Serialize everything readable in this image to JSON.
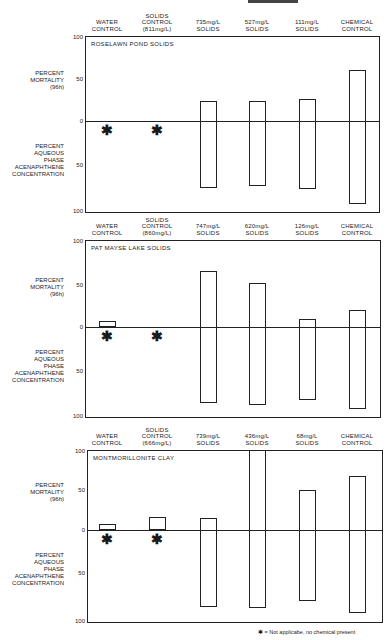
{
  "chart_data": {
    "type": "bar",
    "layout": "three stacked panels, bidirectional bars (mortality up from 0, concentration down from 0)",
    "y_axis_upper": {
      "label": "PERCENT MORTALITY (96h)",
      "range": [
        0,
        100
      ],
      "ticks": [
        "100",
        "50",
        "0"
      ]
    },
    "y_axis_lower": {
      "label": "PERCENT AQUEOUS PHASE ACENAPHTHENE CONCENTRATION",
      "range": [
        0,
        100
      ],
      "ticks": [
        "50",
        "100"
      ]
    },
    "footnote": "= Not applicabe, no chemical present",
    "footnote_symbol": "✱",
    "panels": [
      {
        "title": "ROSELAWN POND SOLIDS",
        "categories": [
          "WATER\nCONTROL",
          "SOLIDS\nCONTROL\n(811mg/L)",
          "735mg/L\nSOLIDS",
          "527mg/L\nSOLIDS",
          "111mg/L\nSOLIDS",
          "CHEMICAL\nCONTROL"
        ],
        "series": [
          {
            "name": "Percent Mortality (96h)",
            "values": [
              0,
              0,
              23,
              24,
              26,
              60
            ]
          },
          {
            "name": "Percent Aqueous Phase Acenaphthene Concentration",
            "values": [
              null,
              null,
              77,
              75,
              78,
              95
            ]
          }
        ],
        "not_applicable": [
          0,
          1
        ]
      },
      {
        "title": "PAT MAYSE LAKE SOLIDS",
        "categories": [
          "WATER\nCONTROL",
          "SOLIDS\nCONTROL\n(860mg/L)",
          "747mg/L\nSOLIDS",
          "620mg/L\nSOLIDS",
          "126mg/L\nSOLIDS",
          "CHEMICAL\nCONTROL"
        ],
        "series": [
          {
            "name": "Percent Mortality (96h)",
            "values": [
              7,
              0,
              67,
              52,
              10,
              20
            ]
          },
          {
            "name": "Percent Aqueous Phase Acenaphthene Concentration",
            "values": [
              null,
              null,
              87,
              90,
              84,
              94
            ]
          }
        ],
        "not_applicable": [
          0,
          1
        ]
      },
      {
        "title": "MONTMORILLONITE CLAY",
        "categories": [
          "WATER\nCONTROL",
          "SOLIDS\nCONTROL\n(666mg/L)",
          "739mg/L\nSOLIDS",
          "436mg/L\nSOLIDS",
          "68mg/L\nSOLIDS",
          "CHEMICAL\nCONTROL"
        ],
        "series": [
          {
            "name": "Percent Mortality (96h)",
            "values": [
              7,
              16,
              15,
              100,
              50,
              67
            ]
          },
          {
            "name": "Percent Aqueous Phase Acenaphthene Concentration",
            "values": [
              null,
              null,
              90,
              91,
              82,
              97
            ]
          }
        ],
        "not_applicable": [
          0,
          1
        ]
      }
    ]
  },
  "labels": {
    "mortality": "PERCENT\nMORTALITY\n(96h)",
    "concentration": "PERCENT\nAQUEOUS\nPHASE\nACENAPHTHENE\nCONCENTRATION",
    "tick_100": "100",
    "tick_50": "50",
    "tick_0": "0"
  },
  "colors": {
    "ink": "#222222",
    "background": "#ffffff"
  }
}
